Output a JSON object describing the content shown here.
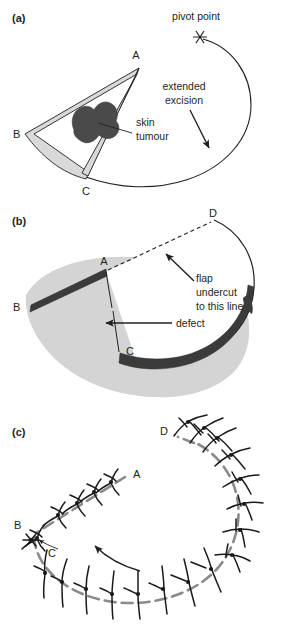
{
  "figure": {
    "background_color": "#ffffff",
    "ink_color": "#231f20",
    "panels": [
      {
        "id": "a",
        "label": "(a)",
        "vertices": [
          {
            "name": "A",
            "label": "A"
          },
          {
            "name": "B",
            "label": "B"
          },
          {
            "name": "C",
            "label": "C"
          }
        ],
        "annotations": [
          {
            "name": "pivot-point",
            "text": "pivot point"
          },
          {
            "name": "extended-excision",
            "text_line_1": "extended",
            "text_line_2": "excision"
          },
          {
            "name": "skin-tumour",
            "text_line_1": "skin",
            "text_line_2": "tumour"
          }
        ],
        "marker": "asterisk",
        "excision_fill": "#d9d9d9",
        "tumour_fill": "#4a4a4a"
      },
      {
        "id": "b",
        "label": "(b)",
        "vertices": [
          {
            "name": "A",
            "label": "A"
          },
          {
            "name": "B",
            "label": "B"
          },
          {
            "name": "C",
            "label": "C"
          },
          {
            "name": "D",
            "label": "D"
          }
        ],
        "annotations": [
          {
            "name": "defect",
            "text": "defect"
          },
          {
            "name": "flap-undercut",
            "text_line_1": "flap",
            "text_line_2": "undercut",
            "text_line_3": "to this line"
          }
        ],
        "base_fill": "#d4d4d4",
        "flap_fill": "#ffffff",
        "cut_edge_fill": "#3b3b3b"
      },
      {
        "id": "c",
        "label": "(c)",
        "vertices": [
          {
            "name": "A",
            "label": "A"
          },
          {
            "name": "B",
            "label": "B"
          },
          {
            "name": "C",
            "label": "C"
          },
          {
            "name": "D",
            "label": "D"
          }
        ],
        "annotations": [],
        "suture_line_color": "#8a8a8a",
        "suture_thread_color": "#1a1a1a",
        "suture_count_upper": 5,
        "suture_count_right": 9,
        "suture_count_lower": 8
      }
    ]
  }
}
